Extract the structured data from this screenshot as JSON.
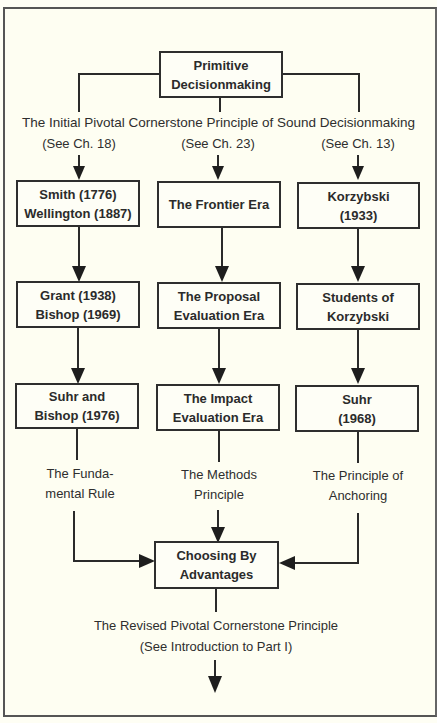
{
  "diagram": {
    "root": {
      "label": "Primitive\nDecisionmaking"
    },
    "initial_principle": "The Initial Pivotal Cornerstone Principle of Sound Decisionmaking",
    "columns": [
      {
        "reference": "(See Ch. 18)",
        "boxes": [
          "Smith (1776)\nWellington (1887)",
          "Grant (1938)\nBishop (1969)",
          "Suhr and\nBishop (1976)"
        ],
        "principle": "The Funda-\nmental Rule"
      },
      {
        "reference": "(See Ch. 23)",
        "boxes": [
          "The Frontier Era",
          "The Proposal\nEvaluation Era",
          "The Impact\nEvaluation Era"
        ],
        "principle": "The Methods\nPrinciple"
      },
      {
        "reference": "(See Ch. 13)",
        "boxes": [
          "Korzybski\n(1933)",
          "Students of\nKorzybski",
          "Suhr\n(1968)"
        ],
        "principle": "The Principle of\nAnchoring"
      }
    ],
    "result": {
      "label": "Choosing By\nAdvantages"
    },
    "revised_principle": "The Revised Pivotal Cornerstone Principle",
    "revised_reference": "(See Introduction to Part I)"
  }
}
